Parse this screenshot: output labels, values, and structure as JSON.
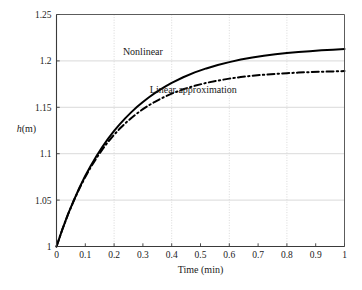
{
  "chart_data": {
    "type": "line",
    "title": "",
    "xlabel": "Time (min)",
    "ylabel": "h(m)",
    "ylabel_italic_part": "h",
    "ylabel_rest": "(m)",
    "xlim": [
      0,
      1
    ],
    "ylim": [
      1,
      1.25
    ],
    "xticks": [
      0,
      0.1,
      0.2,
      0.3,
      0.4,
      0.5,
      0.6,
      0.7,
      0.8,
      0.9,
      1
    ],
    "xtick_labels": [
      "0",
      "0.1",
      "0.2",
      "0.3",
      "0.4",
      "0.5",
      "0.6",
      "0.7",
      "0.8",
      "0.9",
      "1"
    ],
    "yticks": [
      1,
      1.05,
      1.1,
      1.15,
      1.2,
      1.25
    ],
    "ytick_labels": [
      "1",
      "1.05",
      "1.1",
      "1.15",
      "1.2",
      "1.25"
    ],
    "grid": true,
    "grid_x_values": [
      0.2,
      0.4,
      0.6,
      0.8
    ],
    "grid_y_values": [
      1.05,
      1.1,
      1.15,
      1.2
    ],
    "grid_color": "#cfcfcf",
    "legend_position": "inline-annotations",
    "series": [
      {
        "name": "Nonlinear",
        "style": "solid",
        "color": "#000000",
        "linewidth": 2.0,
        "label_position": {
          "x": 0.3,
          "y": 1.2095
        },
        "x": [
          0,
          0.02,
          0.04,
          0.06,
          0.08,
          0.1,
          0.12,
          0.14,
          0.16,
          0.18,
          0.2,
          0.22,
          0.24,
          0.26,
          0.28,
          0.3,
          0.32,
          0.34,
          0.36,
          0.38,
          0.4,
          0.44,
          0.48,
          0.52,
          0.56,
          0.6,
          0.64,
          0.68,
          0.72,
          0.76,
          0.8,
          0.84,
          0.88,
          0.92,
          0.96,
          1.0
        ],
        "y": [
          1.0,
          1.0182,
          1.0348,
          1.0498,
          1.0636,
          1.0762,
          1.0876,
          1.0981,
          1.1077,
          1.1165,
          1.1245,
          1.1319,
          1.1386,
          1.1448,
          1.1505,
          1.1558,
          1.1606,
          1.165,
          1.1691,
          1.1728,
          1.1763,
          1.1824,
          1.1876,
          1.1919,
          1.1956,
          1.1987,
          1.2014,
          1.2036,
          1.2055,
          1.2071,
          1.2084,
          1.2096,
          1.2105,
          1.2114,
          1.2121,
          1.2127
        ]
      },
      {
        "name": "Linear approximation",
        "style": "dashdot",
        "color": "#000000",
        "linewidth": 2.0,
        "label_position": {
          "x": 0.475,
          "y": 1.1695
        },
        "x": [
          0,
          0.02,
          0.04,
          0.06,
          0.08,
          0.1,
          0.12,
          0.14,
          0.16,
          0.18,
          0.2,
          0.22,
          0.24,
          0.26,
          0.28,
          0.3,
          0.32,
          0.34,
          0.36,
          0.38,
          0.4,
          0.44,
          0.48,
          0.52,
          0.56,
          0.6,
          0.64,
          0.68,
          0.72,
          0.76,
          0.8,
          0.84,
          0.88,
          0.92,
          0.96,
          1.0
        ],
        "y": [
          1.0,
          1.0181,
          1.0345,
          1.0493,
          1.0628,
          1.075,
          1.086,
          1.0959,
          1.1049,
          1.1131,
          1.1204,
          1.1271,
          1.1331,
          1.1385,
          1.1435,
          1.148,
          1.152,
          1.1557,
          1.159,
          1.162,
          1.1647,
          1.1694,
          1.1732,
          1.1763,
          1.1788,
          1.1809,
          1.1826,
          1.184,
          1.1851,
          1.186,
          1.1868,
          1.1874,
          1.1879,
          1.1883,
          1.1887,
          1.189
        ]
      }
    ],
    "annotations": [
      {
        "text": "Nonlinear",
        "x": 0.3,
        "y": 1.2095
      },
      {
        "text": "Linear approximation",
        "x": 0.475,
        "y": 1.1695
      }
    ]
  }
}
